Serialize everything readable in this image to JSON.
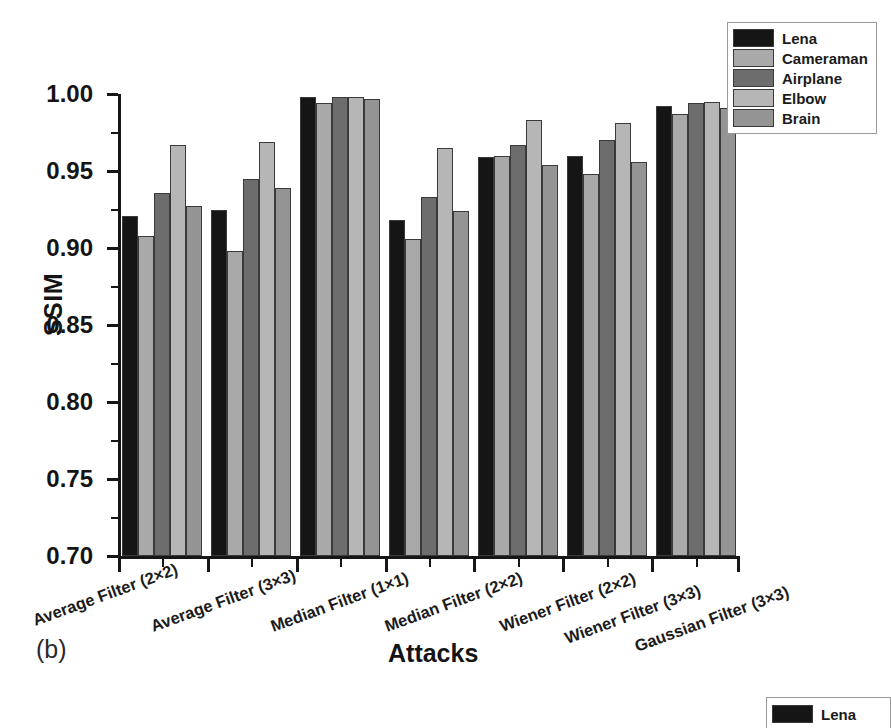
{
  "panel_tag": "(b)",
  "legend": {
    "position": "top-right",
    "entries": [
      {
        "label": "Lena",
        "color": "#151515"
      },
      {
        "label": "Cameraman",
        "color": "#a9a9a9"
      },
      {
        "label": "Airplane",
        "color": "#6d6d6d"
      },
      {
        "label": "Elbow",
        "color": "#b6b6b6"
      },
      {
        "label": "Brain",
        "color": "#949494"
      }
    ]
  },
  "legend_partial": {
    "entries": [
      {
        "label": "Lena",
        "color": "#151515"
      }
    ]
  },
  "chart_data": {
    "type": "bar",
    "title": "",
    "subtitle": "",
    "xlabel": "Attacks",
    "ylabel": "SSIM",
    "ylim": [
      0.7,
      1.0
    ],
    "ytick_labels": [
      "1.00",
      "0.95",
      "0.90",
      "0.85",
      "0.80",
      "0.75",
      "0.70"
    ],
    "ytick_values": [
      1.0,
      0.95,
      0.9,
      0.85,
      0.8,
      0.75,
      0.7
    ],
    "yminor_values": [
      0.975,
      0.925,
      0.875,
      0.825,
      0.775,
      0.725
    ],
    "grid": false,
    "legend_position": "top-right",
    "categories": [
      "Average Filter (2×2)",
      "Average Filter (3×3)",
      "Median Filter (1×1)",
      "Median Filter (2×2)",
      "Wiener Filter (2×2)",
      "Wiener Filter (3×3)",
      "Gaussian Filter (3×3)"
    ],
    "series": [
      {
        "name": "Lena",
        "color": "#151515",
        "values": [
          0.921,
          0.925,
          0.998,
          0.918,
          0.959,
          0.96,
          0.992
        ]
      },
      {
        "name": "Cameraman",
        "color": "#a9a9a9",
        "values": [
          0.908,
          0.898,
          0.994,
          0.906,
          0.96,
          0.948,
          0.987
        ]
      },
      {
        "name": "Airplane",
        "color": "#6d6d6d",
        "values": [
          0.936,
          0.945,
          0.998,
          0.933,
          0.967,
          0.97,
          0.994
        ]
      },
      {
        "name": "Elbow",
        "color": "#b6b6b6",
        "values": [
          0.967,
          0.969,
          0.998,
          0.965,
          0.983,
          0.981,
          0.995
        ]
      },
      {
        "name": "Brain",
        "color": "#949494",
        "values": [
          0.927,
          0.939,
          0.997,
          0.924,
          0.954,
          0.956,
          0.991
        ]
      }
    ]
  }
}
